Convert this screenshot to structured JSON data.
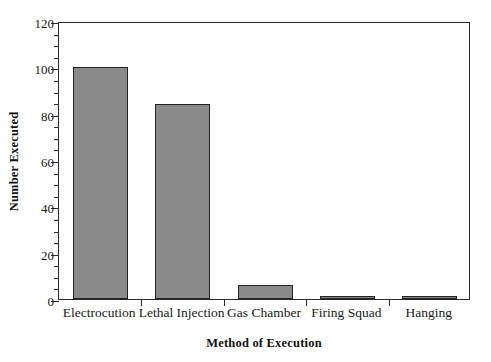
{
  "chart_data": {
    "type": "bar",
    "title": "",
    "xlabel": "Method of Execution",
    "ylabel": "Number Executed",
    "categories": [
      "Electrocution",
      "Lethal Injection",
      "Gas Chamber",
      "Firing Squad",
      "Hanging"
    ],
    "values": [
      100,
      84,
      6,
      1.5,
      1.5
    ],
    "ylim": [
      0,
      120
    ],
    "ytick_labels": [
      "0",
      "20",
      "40",
      "60",
      "80",
      "100",
      "120"
    ],
    "ytick_values": [
      0,
      20,
      40,
      60,
      80,
      100,
      120
    ],
    "yminor_step": 5,
    "grid": false,
    "legend": null,
    "bar_fill_color": "#8a8a8a",
    "bar_edge_color": "#222222",
    "axis_color": "#2a2a2a",
    "background_color": "#ffffff"
  }
}
